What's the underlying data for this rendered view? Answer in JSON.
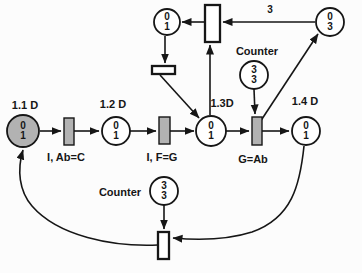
{
  "colors": {
    "background": "#fcfcfc",
    "stroke": "#161616",
    "place_fill": "#ffffff",
    "shaded_fill": "#b2b2b2"
  },
  "places": {
    "top_left": {
      "marking": "0",
      "capacity": "1"
    },
    "top_right": {
      "marking": "0",
      "capacity": "3"
    },
    "counter_top": {
      "marking": "3",
      "capacity": "3"
    },
    "p11": {
      "marking": "0",
      "capacity": "1"
    },
    "p12": {
      "marking": "0",
      "capacity": "1"
    },
    "p13": {
      "marking": "0",
      "capacity": "1"
    },
    "p14": {
      "marking": "0",
      "capacity": "1"
    },
    "counter_bottom": {
      "marking": "3",
      "capacity": "3"
    }
  },
  "labels": {
    "p11": "1.1 D",
    "p12": "1.2 D",
    "p13": "1.3D",
    "p14": "1.4 D",
    "t1": "I, Ab=C",
    "t2": "I, F=G",
    "t3": "G=Ab",
    "counter_top": "Counter",
    "counter_bottom": "Counter",
    "arc_weight": "3"
  }
}
